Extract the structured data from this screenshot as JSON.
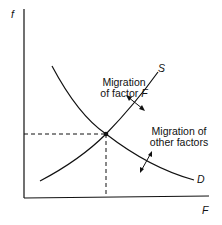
{
  "diagram": {
    "axes": {
      "y_label": "f",
      "x_label": "F"
    },
    "curves": [
      {
        "name": "supply",
        "label": "S"
      },
      {
        "name": "demand",
        "label": "D"
      }
    ],
    "annotations": {
      "migration_factor_line1": "Migration",
      "migration_factor_line2_prefix": "of factor ",
      "migration_factor_line2_var": "F",
      "migration_other_line1": "Migration of",
      "migration_other_line2": "other factors"
    },
    "colors": {
      "line": "#111111",
      "background": "#ffffff"
    }
  }
}
